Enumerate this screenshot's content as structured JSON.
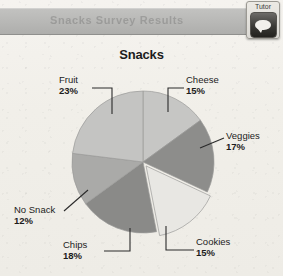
{
  "topbar": {
    "ghost_text": "Snacks Survey Results"
  },
  "tutor_button": {
    "label": "Tutor",
    "icon": "speech-bubble-icon"
  },
  "chart_data": {
    "type": "pie",
    "title": "Snacks",
    "xlabel": "",
    "ylabel": "",
    "legend_position": "none",
    "grid": false,
    "categories": [
      "Cheese",
      "Veggies",
      "Cookies",
      "Chips",
      "No Snack",
      "Fruit"
    ],
    "values": [
      15,
      17,
      15,
      18,
      12,
      23
    ],
    "value_suffix": "%",
    "slices": [
      {
        "label": "Cheese",
        "value": 15,
        "value_text": "15%",
        "color": "#c6c6c4",
        "start_deg": 0,
        "end_deg": 54,
        "exploded": false
      },
      {
        "label": "Veggies",
        "value": 17,
        "value_text": "17%",
        "color": "#8d8d8b",
        "start_deg": 54,
        "end_deg": 115,
        "exploded": false
      },
      {
        "label": "Cookies",
        "value": 15,
        "value_text": "15%",
        "color": "#e8e7e3",
        "start_deg": 115,
        "end_deg": 169,
        "exploded": true
      },
      {
        "label": "Chips",
        "value": 18,
        "value_text": "18%",
        "color": "#8a8a88",
        "start_deg": 169,
        "end_deg": 234,
        "exploded": false
      },
      {
        "label": "No Snack",
        "value": 12,
        "value_text": "12%",
        "color": "#aaaaa8",
        "start_deg": 234,
        "end_deg": 277,
        "exploded": false
      },
      {
        "label": "Fruit",
        "value": 23,
        "value_text": "23%",
        "color": "#c4c4c2",
        "start_deg": 277,
        "end_deg": 360,
        "exploded": false
      }
    ]
  },
  "labels": {
    "fruit": {
      "name": "Fruit",
      "pct": "23%"
    },
    "cheese": {
      "name": "Cheese",
      "pct": "15%"
    },
    "veggies": {
      "name": "Veggies",
      "pct": "17%"
    },
    "cookies": {
      "name": "Cookies",
      "pct": "15%"
    },
    "chips": {
      "name": "Chips",
      "pct": "18%"
    },
    "nosnack": {
      "name": "No Snack",
      "pct": "12%"
    }
  },
  "colors": {
    "page_background": "#f3f1ec",
    "topbar": "#b9b9b7",
    "text": "#1c1c1c",
    "leader_line": "#2a2a2a"
  }
}
